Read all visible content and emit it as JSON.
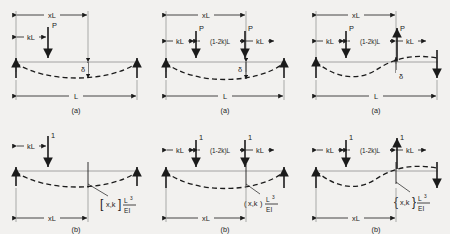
{
  "figure": {
    "background_color": "#f2f1ef",
    "ink_color": "#1b1b1b",
    "columns": 3,
    "rows": 2
  },
  "labels": {
    "span_full": "L",
    "span_x": "xL",
    "span_k": "kL",
    "span_mid": "(1-2k)L",
    "load_P": "P",
    "load_unit": "1",
    "deflection": "δ",
    "caption_a": "(a)",
    "caption_b": "(b)",
    "coef_L": "L",
    "coef_exp": "3",
    "coef_EI": "EI"
  },
  "panels": [
    {
      "id": "top-left",
      "caption": "(a)",
      "row": "top",
      "column": 1,
      "load_symbol": "P",
      "load_count": 1,
      "load_directions": [
        "down"
      ],
      "curve": "sagging",
      "reactions": [
        "up",
        "up"
      ],
      "dimensions": [
        "xL",
        "kL",
        "L"
      ],
      "deflection_marker": "δ",
      "has_coefficient": false
    },
    {
      "id": "top-middle",
      "caption": "(a)",
      "row": "top",
      "column": 2,
      "load_symbol": "P",
      "load_count": 2,
      "load_directions": [
        "down",
        "down"
      ],
      "curve": "sagging",
      "reactions": [
        "up",
        "up"
      ],
      "dimensions": [
        "xL",
        "kL",
        "(1-2k)L",
        "kL",
        "L"
      ],
      "deflection_marker": "δ",
      "has_coefficient": false
    },
    {
      "id": "top-right",
      "caption": "(a)",
      "row": "top",
      "column": 3,
      "load_symbol": "P",
      "load_count": 2,
      "load_directions": [
        "down",
        "up"
      ],
      "curve": "antisymmetric",
      "reactions": [
        "up",
        "down"
      ],
      "dimensions": [
        "xL",
        "kL",
        "(1-2k)L",
        "kL",
        "L"
      ],
      "deflection_marker": "δ",
      "has_coefficient": false
    },
    {
      "id": "bottom-left",
      "caption": "(b)",
      "row": "bottom",
      "column": 1,
      "load_symbol": "1",
      "load_count": 1,
      "load_directions": [
        "down"
      ],
      "curve": "sagging",
      "reactions": [
        "up",
        "up"
      ],
      "dimensions": [
        "kL",
        "xL"
      ],
      "coefficient_bracket": "square",
      "coefficient_open": "[",
      "coefficient_args": "x,k",
      "coefficient_close": "]",
      "has_coefficient": true
    },
    {
      "id": "bottom-middle",
      "caption": "(b)",
      "row": "bottom",
      "column": 2,
      "load_symbol": "1",
      "load_count": 2,
      "load_directions": [
        "down",
        "down"
      ],
      "curve": "sagging",
      "reactions": [
        "up",
        "up"
      ],
      "dimensions": [
        "kL",
        "(1-2k)L",
        "kL",
        "xL"
      ],
      "coefficient_bracket": "paren",
      "coefficient_open": "(",
      "coefficient_args": "x,k",
      "coefficient_close": ")",
      "has_coefficient": true
    },
    {
      "id": "bottom-right",
      "caption": "(b)",
      "row": "bottom",
      "column": 3,
      "load_symbol": "1",
      "load_count": 2,
      "load_directions": [
        "down",
        "up"
      ],
      "curve": "antisymmetric",
      "reactions": [
        "up",
        "down"
      ],
      "dimensions": [
        "kL",
        "(1-2k)L",
        "kL",
        "xL"
      ],
      "coefficient_bracket": "brace",
      "coefficient_open": "{",
      "coefficient_args": "x,k",
      "coefficient_close": "}",
      "has_coefficient": true
    }
  ]
}
